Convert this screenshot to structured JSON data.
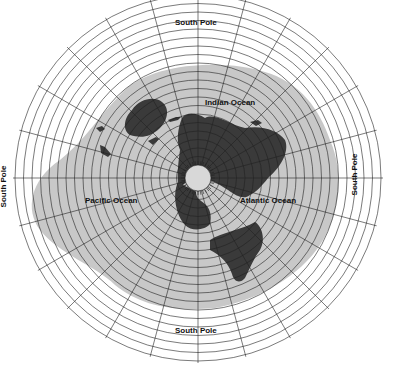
{
  "map": {
    "title": "Azimuthal equidistant projection centered on North Pole",
    "center": {
      "x": 198,
      "y": 178
    },
    "colors": {
      "ocean": "#c8c8c8",
      "land": "#3a3a3a",
      "grid": "#222222",
      "outer": "#ffffff",
      "pole_disc": "#d8d8d8"
    },
    "labels": {
      "top": "South Pole",
      "bottom": "South Pole",
      "left": "South Pole",
      "right": "South Pole",
      "indian": "Indian Ocean",
      "pacific": "Pacific Ocean",
      "atlantic": "Atlantic Ocean"
    }
  }
}
